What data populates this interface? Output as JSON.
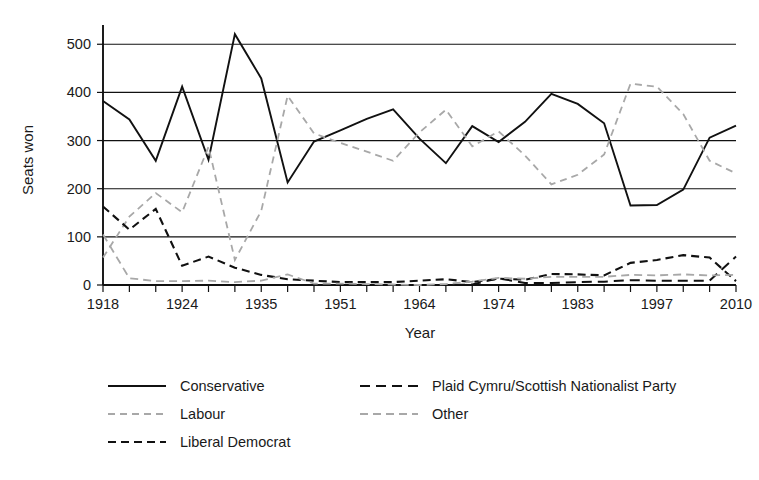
{
  "chart_data": {
    "type": "line",
    "title": "",
    "xlabel": "Year",
    "ylabel": "Seats won",
    "ylim": [
      0,
      540
    ],
    "yticks": [
      0,
      100,
      200,
      300,
      400,
      500
    ],
    "grid": true,
    "legend_position": "bottom",
    "x": [
      1918,
      1922,
      1923,
      1924,
      1929,
      1931,
      1935,
      1945,
      1950,
      1951,
      1955,
      1959,
      1964,
      1966,
      1970,
      1974,
      1979,
      1983,
      1987,
      1992,
      1997,
      2001,
      2005,
      2010,
      2015
    ],
    "xtick_labels": [
      "1918",
      "1924",
      "1935",
      "1951",
      "1964",
      "1974",
      "1983",
      "1997",
      "2010"
    ],
    "xtick_label_indices": [
      0,
      3,
      6,
      9,
      12,
      15,
      18,
      21,
      24
    ],
    "series": [
      {
        "name": "Conservative",
        "style": "solid",
        "color": "#111111",
        "values": [
          382,
          344,
          258,
          412,
          260,
          521,
          429,
          213,
          298,
          321,
          345,
          365,
          304,
          253,
          330,
          297,
          339,
          397,
          376,
          336,
          165,
          166,
          198,
          306,
          331
        ]
      },
      {
        "name": "Labour",
        "style": "dashed-gray",
        "color": "#a8a8a8",
        "values": [
          57,
          142,
          191,
          151,
          287,
          52,
          154,
          393,
          315,
          295,
          277,
          258,
          317,
          364,
          288,
          319,
          269,
          209,
          229,
          271,
          418,
          412,
          355,
          258,
          232
        ]
      },
      {
        "name": "Liberal Democrat",
        "style": "dashed-black",
        "color": "#111111",
        "values": [
          163,
          115,
          158,
          40,
          59,
          36,
          21,
          12,
          9,
          6,
          6,
          6,
          9,
          12,
          6,
          13,
          11,
          23,
          22,
          20,
          46,
          52,
          62,
          57,
          8
        ]
      },
      {
        "name": "Plaid Cymru/Scottish Nationalist Party",
        "style": "dashed-black-long",
        "color": "#111111",
        "values": [
          0,
          0,
          0,
          0,
          0,
          0,
          0,
          0,
          0,
          0,
          0,
          0,
          0,
          0,
          1,
          14,
          4,
          4,
          6,
          7,
          10,
          9,
          9,
          9,
          59
        ]
      },
      {
        "name": "Other",
        "style": "dashed-gray-long",
        "color": "#a8a8a8",
        "values": [
          105,
          14,
          8,
          8,
          9,
          6,
          9,
          22,
          3,
          3,
          2,
          1,
          0,
          2,
          7,
          15,
          13,
          17,
          17,
          17,
          21,
          20,
          22,
          20,
          21
        ]
      }
    ]
  },
  "legend": {
    "entries": [
      {
        "label": "Conservative",
        "style": "solid",
        "color": "#111111"
      },
      {
        "label": "Labour",
        "style": "dashed-gray",
        "color": "#a8a8a8"
      },
      {
        "label": "Liberal Democrat",
        "style": "dashed-black",
        "color": "#111111"
      },
      {
        "label": "Plaid Cymru/Scottish Nationalist Party",
        "style": "dashed-black-long",
        "color": "#111111"
      },
      {
        "label": "Other",
        "style": "dashed-gray-long",
        "color": "#a8a8a8"
      }
    ]
  }
}
